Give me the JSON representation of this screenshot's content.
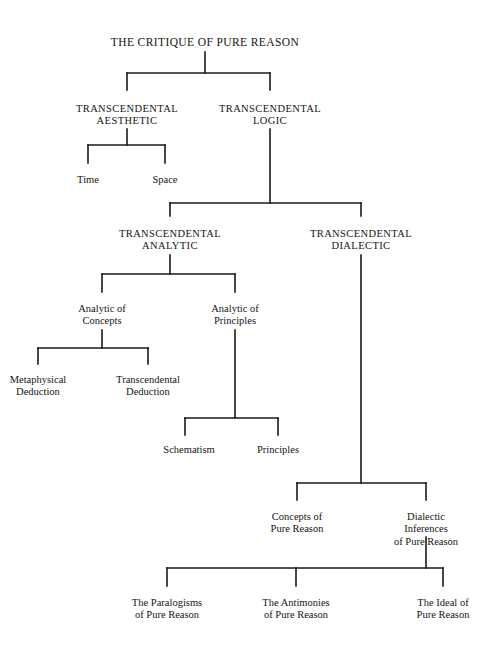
{
  "diagram": {
    "title_text": "THE CRITIQUE OF PURE REASON",
    "type": "tree-diagram",
    "line_color": "#1a1a1a",
    "background_color": "#ffffff",
    "text_color": "#141414",
    "nodes": [
      {
        "id": "critique",
        "label": "THE CRITIQUE OF PURE REASON",
        "style": "caps",
        "x": 205,
        "y": 36,
        "size": 11.5
      },
      {
        "id": "aesthetic",
        "label": "TRANSCENDENTAL\nAESTHETIC",
        "style": "caps",
        "x": 127,
        "y": 103,
        "size": 10.5
      },
      {
        "id": "logic",
        "label": "TRANSCENDENTAL\nLOGIC",
        "style": "caps",
        "x": 270,
        "y": 103,
        "size": 10.5
      },
      {
        "id": "time",
        "label": "Time",
        "style": "mixed",
        "x": 88,
        "y": 174,
        "size": 10.5
      },
      {
        "id": "space",
        "label": "Space",
        "style": "mixed",
        "x": 165,
        "y": 174,
        "size": 10.5
      },
      {
        "id": "analytic",
        "label": "TRANSCENDENTAL\nANALYTIC",
        "style": "caps",
        "x": 170,
        "y": 228,
        "size": 10.5
      },
      {
        "id": "dialectic",
        "label": "TRANSCENDENTAL\nDIALECTIC",
        "style": "caps",
        "x": 361,
        "y": 228,
        "size": 10.5
      },
      {
        "id": "analytic-concepts",
        "label": "Analytic of\nConcepts",
        "style": "mixed",
        "x": 102,
        "y": 303,
        "size": 10.5
      },
      {
        "id": "analytic-principles",
        "label": "Analytic of\nPrinciples",
        "style": "mixed",
        "x": 235,
        "y": 303,
        "size": 10.5
      },
      {
        "id": "metaphysical-deduction",
        "label": "Metaphysical\nDeduction",
        "style": "mixed",
        "x": 38,
        "y": 374,
        "size": 10.5
      },
      {
        "id": "transcendental-deduction",
        "label": "Transcendental\nDeduction",
        "style": "mixed",
        "x": 148,
        "y": 374,
        "size": 10.5
      },
      {
        "id": "schematism",
        "label": "Schematism",
        "style": "mixed",
        "x": 189,
        "y": 444,
        "size": 10.5
      },
      {
        "id": "principles",
        "label": "Principles",
        "style": "mixed",
        "x": 278,
        "y": 444,
        "size": 10.5
      },
      {
        "id": "concepts-pure-reason",
        "label": "Concepts of\nPure Reason",
        "style": "mixed",
        "x": 297,
        "y": 511,
        "size": 10.5
      },
      {
        "id": "dialectic-inferences",
        "label": "Dialectic Inferences\nof Pure Reason",
        "style": "mixed",
        "x": 426,
        "y": 511,
        "size": 10.5
      },
      {
        "id": "paralogisms",
        "label": "The Paralogisms\nof Pure Reason",
        "style": "mixed",
        "x": 167,
        "y": 597,
        "size": 10.5
      },
      {
        "id": "antinomies",
        "label": "The Antimonies\nof Pure Reason",
        "style": "mixed",
        "x": 296,
        "y": 597,
        "size": 10.5
      },
      {
        "id": "ideal",
        "label": "The Ideal of\nPure Reason",
        "style": "mixed",
        "x": 443,
        "y": 597,
        "size": 10.5
      }
    ],
    "connectors": [
      {
        "name": "critique-stem",
        "x1": 205,
        "y1": 52,
        "x2": 205,
        "y2": 73
      },
      {
        "name": "critique-crossbar",
        "x1": 127,
        "y1": 73,
        "x2": 270,
        "y2": 73
      },
      {
        "name": "aesthetic-drop",
        "x1": 127,
        "y1": 73,
        "x2": 127,
        "y2": 90
      },
      {
        "name": "logic-drop",
        "x1": 270,
        "y1": 73,
        "x2": 270,
        "y2": 90
      },
      {
        "name": "aesthetic-stem",
        "x1": 127,
        "y1": 129,
        "x2": 127,
        "y2": 145
      },
      {
        "name": "aesthetic-crossbar",
        "x1": 88,
        "y1": 145,
        "x2": 165,
        "y2": 145
      },
      {
        "name": "time-drop",
        "x1": 88,
        "y1": 145,
        "x2": 88,
        "y2": 163
      },
      {
        "name": "space-drop",
        "x1": 165,
        "y1": 145,
        "x2": 165,
        "y2": 163
      },
      {
        "name": "logic-stem",
        "x1": 270,
        "y1": 129,
        "x2": 270,
        "y2": 203
      },
      {
        "name": "logic-crossbar",
        "x1": 170,
        "y1": 203,
        "x2": 361,
        "y2": 203
      },
      {
        "name": "analytic-drop",
        "x1": 170,
        "y1": 203,
        "x2": 170,
        "y2": 216
      },
      {
        "name": "dialectic-drop",
        "x1": 361,
        "y1": 203,
        "x2": 361,
        "y2": 216
      },
      {
        "name": "analytic-stem",
        "x1": 170,
        "y1": 255,
        "x2": 170,
        "y2": 274
      },
      {
        "name": "analytic-crossbar",
        "x1": 102,
        "y1": 274,
        "x2": 235,
        "y2": 274
      },
      {
        "name": "analytic-concepts-drop",
        "x1": 102,
        "y1": 274,
        "x2": 102,
        "y2": 292
      },
      {
        "name": "analytic-principles-drop",
        "x1": 235,
        "y1": 274,
        "x2": 235,
        "y2": 292
      },
      {
        "name": "concepts-stem",
        "x1": 102,
        "y1": 330,
        "x2": 102,
        "y2": 348
      },
      {
        "name": "concepts-crossbar",
        "x1": 38,
        "y1": 348,
        "x2": 148,
        "y2": 348
      },
      {
        "name": "metaphysical-drop",
        "x1": 38,
        "y1": 348,
        "x2": 38,
        "y2": 364
      },
      {
        "name": "transcendental-deduction-drop",
        "x1": 148,
        "y1": 348,
        "x2": 148,
        "y2": 364
      },
      {
        "name": "principles-stem",
        "x1": 235,
        "y1": 330,
        "x2": 235,
        "y2": 418
      },
      {
        "name": "principles-crossbar",
        "x1": 185,
        "y1": 418,
        "x2": 278,
        "y2": 418
      },
      {
        "name": "schematism-drop",
        "x1": 185,
        "y1": 418,
        "x2": 185,
        "y2": 435
      },
      {
        "name": "principles-leaf-drop",
        "x1": 278,
        "y1": 418,
        "x2": 278,
        "y2": 435
      },
      {
        "name": "dialectic-stem",
        "x1": 361,
        "y1": 255,
        "x2": 361,
        "y2": 483
      },
      {
        "name": "dialectic-crossbar",
        "x1": 297,
        "y1": 483,
        "x2": 426,
        "y2": 483
      },
      {
        "name": "concepts-pure-reason-drop",
        "x1": 297,
        "y1": 483,
        "x2": 297,
        "y2": 500
      },
      {
        "name": "dialectic-inferences-drop",
        "x1": 426,
        "y1": 483,
        "x2": 426,
        "y2": 500
      },
      {
        "name": "inferences-stem",
        "x1": 426,
        "y1": 537,
        "x2": 426,
        "y2": 568
      },
      {
        "name": "inferences-crossbar",
        "x1": 167,
        "y1": 568,
        "x2": 443,
        "y2": 568
      },
      {
        "name": "paralogisms-drop",
        "x1": 167,
        "y1": 568,
        "x2": 167,
        "y2": 586
      },
      {
        "name": "antinomies-drop",
        "x1": 296,
        "y1": 568,
        "x2": 296,
        "y2": 586
      },
      {
        "name": "ideal-drop",
        "x1": 443,
        "y1": 568,
        "x2": 443,
        "y2": 586
      }
    ]
  }
}
